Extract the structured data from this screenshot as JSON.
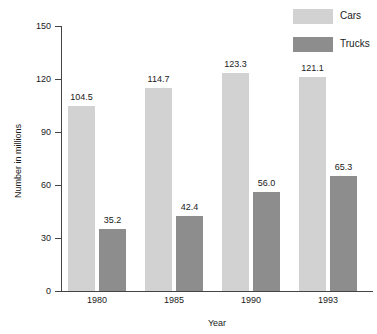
{
  "chart_data": {
    "type": "bar",
    "title": "",
    "xlabel": "Year",
    "ylabel": "Number in millions",
    "categories": [
      "1980",
      "1985",
      "1990",
      "1993"
    ],
    "series": [
      {
        "name": "Cars",
        "color": "#d2d2d2",
        "values": [
          104.5,
          114.7,
          123.3,
          121.1
        ],
        "labels": [
          "104.5",
          "114.7",
          "123.3",
          "121.1"
        ]
      },
      {
        "name": "Trucks",
        "color": "#8d8d8d",
        "values": [
          35.2,
          42.4,
          56.0,
          65.3
        ],
        "labels": [
          "35.2",
          "42.4",
          "56.0",
          "65.3"
        ]
      }
    ],
    "ylim": [
      0,
      150
    ],
    "yticks": [
      0,
      30,
      60,
      90,
      120,
      150
    ],
    "ytick_labels": [
      "0",
      "30",
      "60",
      "90",
      "120",
      "150"
    ],
    "grid": false,
    "legend_position": "top-right"
  },
  "legend": {
    "entries": [
      {
        "label": "Cars",
        "color": "#d2d2d2"
      },
      {
        "label": "Trucks",
        "color": "#8d8d8d"
      }
    ]
  },
  "axes": {
    "y_title": "Number in millions",
    "x_title": "Year"
  },
  "colors": {
    "cars": "#d2d2d2",
    "trucks": "#8d8d8d",
    "axis": "#444444",
    "text": "#1a1a1a",
    "background": "#ffffff"
  }
}
